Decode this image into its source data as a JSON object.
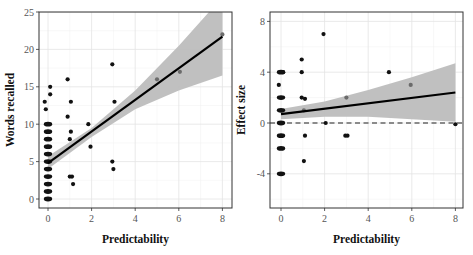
{
  "chart_data": [
    {
      "type": "scatter",
      "title": "",
      "xlabel": "Predictability",
      "ylabel": "Words recalled",
      "xlim": [
        -0.3,
        8.4
      ],
      "ylim": [
        -1.2,
        25
      ],
      "xticks": [
        0,
        2,
        4,
        6,
        8
      ],
      "yticks": [
        0,
        5,
        10,
        15,
        20,
        25
      ],
      "xtick_labels": [
        "0",
        "2",
        "4",
        "6",
        "8"
      ],
      "ytick_labels": [
        "0",
        "5",
        "10",
        "15",
        "20",
        "25"
      ],
      "grid": true,
      "legend": null,
      "points": [
        {
          "x": 0,
          "y": 0
        },
        {
          "x": 0,
          "y": 1
        },
        {
          "x": 0,
          "y": 2
        },
        {
          "x": 0,
          "y": 3
        },
        {
          "x": 0,
          "y": 4
        },
        {
          "x": 0,
          "y": 5
        },
        {
          "x": 0,
          "y": 6
        },
        {
          "x": 0,
          "y": 7
        },
        {
          "x": 0,
          "y": 8
        },
        {
          "x": 0,
          "y": 9
        },
        {
          "x": 0,
          "y": 10
        },
        {
          "x": -0.1,
          "y": 12
        },
        {
          "x": -0.15,
          "y": 13
        },
        {
          "x": 0.1,
          "y": 14
        },
        {
          "x": 0.1,
          "y": 15
        },
        {
          "x": 0.9,
          "y": 16
        },
        {
          "x": 0.9,
          "y": 11
        },
        {
          "x": 1.05,
          "y": 13
        },
        {
          "x": 1.05,
          "y": 9
        },
        {
          "x": 1.0,
          "y": 8
        },
        {
          "x": 1.0,
          "y": 3
        },
        {
          "x": 1.1,
          "y": 3
        },
        {
          "x": 1.15,
          "y": 2
        },
        {
          "x": 1.85,
          "y": 10
        },
        {
          "x": 1.95,
          "y": 7
        },
        {
          "x": 2.95,
          "y": 18
        },
        {
          "x": 3.05,
          "y": 13
        },
        {
          "x": 2.95,
          "y": 5
        },
        {
          "x": 3.0,
          "y": 4
        },
        {
          "x": 5.0,
          "y": 16
        },
        {
          "x": 6.05,
          "y": 17
        },
        {
          "x": 8.0,
          "y": 22
        }
      ],
      "regression": {
        "x": [
          0,
          8
        ],
        "y": [
          4.8,
          21.7
        ]
      },
      "confidence_band": {
        "x": [
          0,
          2,
          4,
          6,
          8
        ],
        "lower": [
          4.0,
          8.3,
          12.0,
          14.5,
          16.5
        ],
        "upper": [
          5.7,
          9.5,
          14.5,
          20.5,
          27.0
        ]
      },
      "colors": {
        "points": "#111111",
        "line": "#000000",
        "band": "#bdbdbd"
      }
    },
    {
      "type": "scatter",
      "title": "",
      "xlabel": "Predictability",
      "ylabel": "Effect size",
      "xlim": [
        -0.3,
        8.4
      ],
      "ylim": [
        -6.8,
        8.7
      ],
      "xticks": [
        0,
        2,
        4,
        6,
        8
      ],
      "yticks": [
        -4,
        0,
        4,
        8
      ],
      "xtick_labels": [
        "0",
        "2",
        "4",
        "6",
        "8"
      ],
      "ytick_labels": [
        "-4",
        "0",
        "4",
        "8"
      ],
      "grid": true,
      "legend": null,
      "reference_line": {
        "y": 0,
        "style": "dashed"
      },
      "points": [
        {
          "x": 0,
          "y": -4
        },
        {
          "x": 0,
          "y": -2
        },
        {
          "x": 0,
          "y": -1
        },
        {
          "x": 0,
          "y": 0
        },
        {
          "x": 0,
          "y": 1
        },
        {
          "x": 0,
          "y": 2
        },
        {
          "x": -0.1,
          "y": 3
        },
        {
          "x": 0,
          "y": 4
        },
        {
          "x": 0.1,
          "y": 4
        },
        {
          "x": 0.95,
          "y": 5
        },
        {
          "x": 0.95,
          "y": 4
        },
        {
          "x": 0.95,
          "y": 2
        },
        {
          "x": 1.1,
          "y": 1.9
        },
        {
          "x": 1.05,
          "y": 1
        },
        {
          "x": 1.1,
          "y": -1
        },
        {
          "x": 1.05,
          "y": -3
        },
        {
          "x": 1.95,
          "y": 7
        },
        {
          "x": 2.05,
          "y": 0
        },
        {
          "x": 3.0,
          "y": 2
        },
        {
          "x": 2.95,
          "y": -1
        },
        {
          "x": 3.05,
          "y": -1
        },
        {
          "x": 4.95,
          "y": 4
        },
        {
          "x": 5.95,
          "y": 3
        },
        {
          "x": 8.0,
          "y": -0.1
        }
      ],
      "regression": {
        "x": [
          0,
          8
        ],
        "y": [
          0.7,
          2.4
        ]
      },
      "confidence_band": {
        "x": [
          0,
          2,
          4,
          6,
          8
        ],
        "lower": [
          0.3,
          0.5,
          0.5,
          0.3,
          0.1
        ],
        "upper": [
          1.1,
          1.7,
          2.6,
          3.6,
          4.7
        ]
      },
      "colors": {
        "points": "#111111",
        "line": "#000000",
        "band": "#bdbdbd",
        "reference": "#222222"
      }
    }
  ]
}
